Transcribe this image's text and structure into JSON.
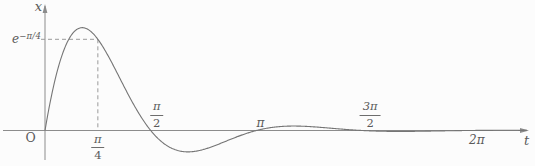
{
  "figure": {
    "y_axis_label": "x",
    "x_axis_label": "t",
    "origin_label": "O",
    "y_value_label": {
      "base": "e",
      "exponent": "−π/4"
    }
  },
  "colors": {
    "background": "#fcfcfc",
    "axis": "#8c8c8c",
    "curve": "#757575",
    "dashed": "#9a9a9a",
    "text": "#5a5a5a"
  },
  "chart_data": {
    "type": "line",
    "title": "",
    "function": "x(t) = e^(-t)·sin(2t)",
    "params": {
      "amplitude": 1,
      "decay_rate": 1,
      "angular_frequency": 2
    },
    "xlabel": "t",
    "ylabel": "x",
    "xlim": [
      0,
      7.16
    ],
    "ylim": [
      -0.18,
      0.63
    ],
    "grid": false,
    "legend": false,
    "x_ticks": [
      {
        "value": 0.7853981634,
        "num": "π",
        "den": "4",
        "side": "below",
        "dx": 0
      },
      {
        "value": 1.5707963268,
        "num": "π",
        "den": "2",
        "side": "above",
        "dx": 6
      },
      {
        "value": 3.1415926536,
        "label": "π",
        "side": "above",
        "dx": 4
      },
      {
        "value": 4.7123889804,
        "num": "3π",
        "den": "2",
        "side": "above",
        "dx": 8
      },
      {
        "value": 6.2831853072,
        "label": "2π",
        "side": "below",
        "dx": 9
      }
    ],
    "y_ticks": [
      {
        "value": 0.4559381277,
        "label": "e^(−π/4)"
      }
    ],
    "marked_point": {
      "t": 0.7853981634,
      "x": 0.4559381277,
      "t_label": "π/4",
      "x_label": "e^(−π/4)",
      "style": "dashed-guides"
    },
    "zeros": [
      0,
      1.5707963268,
      3.1415926536,
      4.7123889804,
      6.2831853072
    ],
    "samples": {
      "t": [
        0,
        0.25,
        0.5,
        0.75,
        1.0,
        1.25,
        1.5,
        1.75,
        2.0,
        2.25,
        2.5,
        2.75,
        3.0,
        3.25,
        3.5,
        3.75,
        4.0,
        4.25,
        4.5,
        4.75,
        5.0,
        5.25,
        5.5,
        5.75,
        6.0,
        6.25,
        6.5,
        6.75,
        7.0
      ],
      "x": [
        0,
        0.3734,
        0.5104,
        0.4712,
        0.3345,
        0.1715,
        0.0315,
        -0.061,
        -0.1024,
        -0.103,
        -0.0787,
        -0.0451,
        -0.0139,
        0.0083,
        0.0198,
        0.0221,
        0.0181,
        0.0114,
        0.0046,
        -0.0007,
        -0.0037,
        -0.0046,
        -0.0041,
        -0.0028,
        -0.0013,
        -0.0001,
        0.0006,
        0.0009,
        0.0009
      ]
    }
  }
}
